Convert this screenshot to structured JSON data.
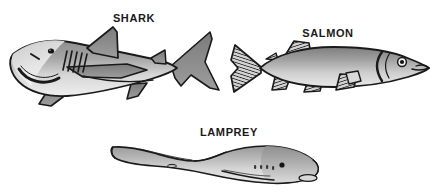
{
  "figure": {
    "background_color": "#ffffff",
    "width": 445,
    "height": 192
  },
  "labels": {
    "shark": "SHARK",
    "salmon": "SALMON",
    "lamprey": "LAMPREY"
  },
  "organisms": [
    {
      "name": "shark",
      "label": "SHARK",
      "facing": "left",
      "parts": [
        "snout",
        "eye",
        "nostril",
        "mouth",
        "gill-slits",
        "dorsal-fin",
        "second-dorsal-fin",
        "pectoral-fin",
        "pelvic-fin",
        "anal-fin",
        "caudal-fin"
      ],
      "gill_slit_count": 5,
      "caudal_fin_type": "heterocercal"
    },
    {
      "name": "salmon",
      "label": "SALMON",
      "facing": "right",
      "parts": [
        "snout",
        "mouth",
        "eye",
        "operculum",
        "dorsal-fin",
        "adipose-fin",
        "pectoral-fin",
        "pelvic-fin",
        "anal-fin",
        "caudal-fin"
      ],
      "caudal_fin_type": "homocercal-forked"
    },
    {
      "name": "lamprey",
      "label": "LAMPREY",
      "facing": "right",
      "parts": [
        "oral-disc",
        "eye",
        "gill-pores",
        "dorsal-fin",
        "second-dorsal-fin",
        "caudal-fin"
      ],
      "gill_pore_count": 7,
      "caudal_fin_type": "continuous-tail-fin"
    }
  ],
  "colors": {
    "outline": "#1a1a1a",
    "body_dark": "#6e6e6e",
    "body_mid": "#9a9a9a",
    "body_light": "#d9d9d9",
    "belly": "#efefef",
    "fin_dark": "#6b6b6b",
    "label_text": "#1a1a1a",
    "background": "#ffffff"
  }
}
